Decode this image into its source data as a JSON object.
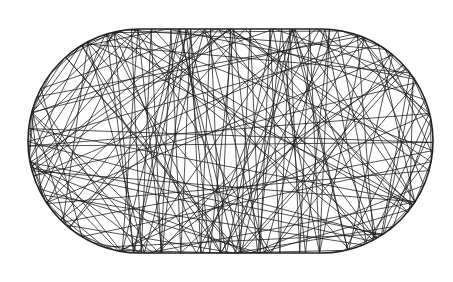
{
  "diagram": {
    "type": "stadium-billiard-trajectory",
    "background": "#ffffff",
    "stroke_color": "#1a1a1a",
    "boundary_color": "#222222",
    "boundary_width": 1.6,
    "trajectory_width": 0.75,
    "stadium": {
      "left_x": 28,
      "right_x": 433,
      "top_y": 29,
      "bottom_y": 253,
      "radius": 112
    },
    "trajectory": {
      "start_x": 200,
      "start_y": 140,
      "start_angle_deg": 37.3,
      "bounces": 190
    }
  }
}
